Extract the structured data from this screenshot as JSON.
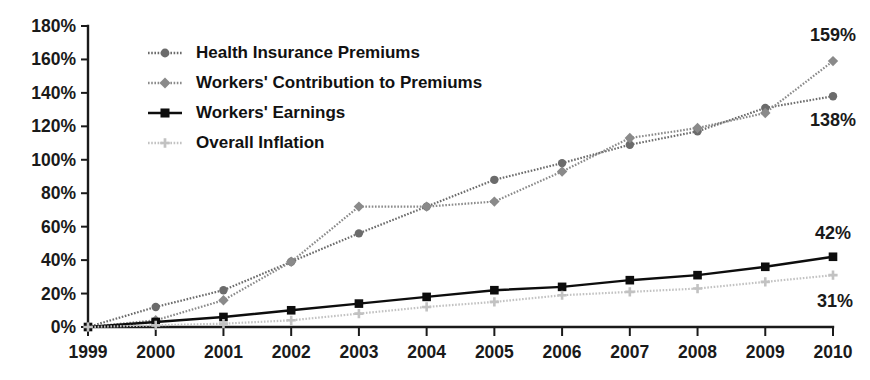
{
  "chart_data": {
    "type": "line",
    "title": "",
    "subtitle": "",
    "xlabel": "",
    "ylabel": "",
    "grid": false,
    "legend_position": "top-left",
    "x": [
      "1999",
      "2000",
      "2001",
      "2002",
      "2003",
      "2004",
      "2005",
      "2006",
      "2007",
      "2008",
      "2009",
      "2010"
    ],
    "categories": [
      "1999",
      "2000",
      "2001",
      "2002",
      "2003",
      "2004",
      "2005",
      "2006",
      "2007",
      "2008",
      "2009",
      "2010"
    ],
    "xlim": [
      1999,
      2010
    ],
    "ylim": [
      0,
      180
    ],
    "ytick_labels": [
      "180%",
      "160%",
      "140%",
      "120%",
      "100%",
      "80%",
      "60%",
      "40%",
      "20%",
      "0%"
    ],
    "ytick_values": [
      180,
      160,
      140,
      120,
      100,
      80,
      60,
      40,
      20,
      0
    ],
    "xtick_labels": [
      "1999",
      "2000",
      "2001",
      "2002",
      "2003",
      "2004",
      "2005",
      "2006",
      "2007",
      "2008",
      "2009",
      "2010"
    ],
    "series": [
      {
        "name": "Health Insurance Premiums",
        "marker": "circle",
        "color": "#6b6b6b",
        "line_style": "dotted",
        "values": [
          0,
          12,
          22,
          39,
          56,
          72,
          88,
          98,
          109,
          117,
          131,
          138
        ],
        "end_label": "138%"
      },
      {
        "name": "Workers' Contribution to Premiums",
        "marker": "diamond",
        "color": "#8a8a8a",
        "line_style": "dotted",
        "values": [
          0,
          4,
          16,
          39,
          72,
          72,
          75,
          93,
          113,
          119,
          128,
          159
        ],
        "end_label": "159%"
      },
      {
        "name": "Workers' Earnings",
        "marker": "square",
        "color": "#0d0d0d",
        "line_style": "solid",
        "values": [
          0,
          3,
          6,
          10,
          14,
          18,
          22,
          24,
          28,
          31,
          36,
          42
        ],
        "end_label": "42%"
      },
      {
        "name": "Overall Inflation",
        "marker": "cross",
        "color": "#c2c2c2",
        "line_style": "dotted",
        "values": [
          0,
          1,
          2,
          4,
          8,
          12,
          15,
          19,
          21,
          23,
          27,
          31
        ],
        "end_label": "31%"
      }
    ],
    "annotations": [
      {
        "text": "159%",
        "series": "Workers' Contribution to Premiums",
        "at_x": "2010",
        "at_y": 159
      },
      {
        "text": "138%",
        "series": "Health Insurance Premiums",
        "at_x": "2010",
        "at_y": 138
      },
      {
        "text": "42%",
        "series": "Workers' Earnings",
        "at_x": "2010",
        "at_y": 42
      },
      {
        "text": "31%",
        "series": "Overall Inflation",
        "at_x": "2010",
        "at_y": 31
      }
    ]
  },
  "legend": {
    "entries": [
      {
        "label": "Health Insurance Premiums"
      },
      {
        "label": "Workers' Contribution to Premiums"
      },
      {
        "label": "Workers' Earnings"
      },
      {
        "label": "Overall Inflation"
      }
    ]
  },
  "colors": {
    "background": "#ffffff",
    "axis": "#1a1a1a",
    "text": "#1a1a1a",
    "premiums": "#6b6b6b",
    "contribution": "#8a8a8a",
    "earnings": "#0d0d0d",
    "inflation": "#c2c2c2"
  }
}
